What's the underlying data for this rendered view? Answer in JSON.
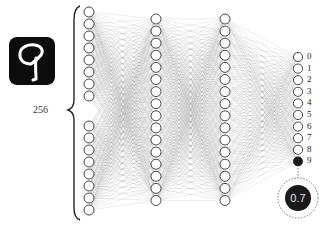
{
  "input_image": {
    "digit": "9",
    "background_color": "#0d0d0d",
    "stroke_color": "#ffffff"
  },
  "input_layer": {
    "size_label": "256",
    "visible_nodes_top": 8,
    "visible_nodes_bottom": 8
  },
  "hidden_layers": [
    {
      "nodes": 16
    },
    {
      "nodes": 16
    }
  ],
  "output_layer": {
    "labels": [
      "0",
      "1",
      "2",
      "3",
      "4",
      "5",
      "6",
      "7",
      "8",
      "9"
    ],
    "active_index": 9,
    "active_color": "#1a1a1a"
  },
  "prediction": {
    "value": "0.7"
  },
  "colors": {
    "node_stroke": "#333333",
    "edge": "#9a9a9a"
  }
}
